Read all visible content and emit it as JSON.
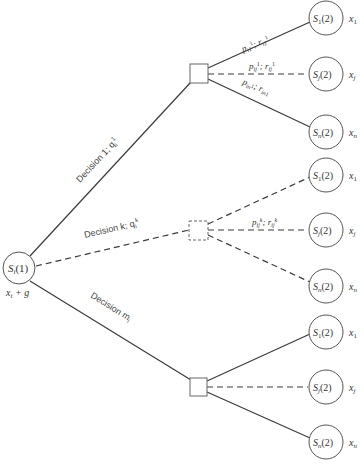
{
  "diagram": {
    "type": "decision-tree",
    "root": {
      "label": "S",
      "sub": "i",
      "arg": "(1)",
      "below_label": "x",
      "below_sub": "i",
      "below_rest": " + g"
    },
    "decisions": [
      {
        "label": "Decision 1; q",
        "sup": "1",
        "sub": "i",
        "style": "solid",
        "branches": [
          {
            "state": "S",
            "state_sub": "1",
            "arg": "(2)",
            "value": "x",
            "value_sub": "1",
            "edge_label": "p",
            "edge_label_sub": "i1",
            "edge_label_sup": "1",
            "edge_label2": "; r",
            "edge_label2_sub": "i1",
            "edge_label2_sup": "1",
            "style": "solid"
          },
          {
            "state": "S",
            "state_sub": "j",
            "arg": "(2)",
            "value": "x",
            "value_sub": "j",
            "edge_label": "p",
            "edge_label_sub": "ij",
            "edge_label_sup": "1",
            "edge_label2": "; r",
            "edge_label2_sub": "ij",
            "edge_label2_sup": "1",
            "style": "dashed"
          },
          {
            "state": "S",
            "state_sub": "n",
            "arg": "(2)",
            "value": "x",
            "value_sub": "n",
            "edge_label": "p",
            "edge_label_sub": "in",
            "edge_label_sup": "1",
            "edge_label2": "; r",
            "edge_label2_sub": "in",
            "edge_label2_sup": "1",
            "style": "solid"
          }
        ]
      },
      {
        "label": "Decision k; q",
        "sup": "k",
        "sub": "i",
        "style": "dashed",
        "branches": [
          {
            "state": "S",
            "state_sub": "1",
            "arg": "(2)",
            "value": "x",
            "value_sub": "1",
            "style": "dashed"
          },
          {
            "state": "S",
            "state_sub": "j",
            "arg": "(2)",
            "value": "x",
            "value_sub": "j",
            "edge_label": "p",
            "edge_label_sub": "ij",
            "edge_label_sup": "k",
            "edge_label2": "; r",
            "edge_label2_sub": "ij",
            "edge_label2_sup": "k",
            "style": "dashed"
          },
          {
            "state": "S",
            "state_sub": "n",
            "arg": "(2)",
            "value": "x",
            "value_sub": "n",
            "style": "dashed"
          }
        ]
      },
      {
        "label": "Decision m",
        "sup": "",
        "sub": "i",
        "style": "solid",
        "branches": [
          {
            "state": "S",
            "state_sub": "1",
            "arg": "(2)",
            "value": "x",
            "value_sub": "1",
            "style": "solid"
          },
          {
            "state": "S",
            "state_sub": "j",
            "arg": "(2)",
            "value": "x",
            "value_sub": "j",
            "style": "dashed"
          },
          {
            "state": "S",
            "state_sub": "n",
            "arg": "(2)",
            "value": "x",
            "value_sub": "n",
            "style": "solid"
          }
        ]
      }
    ]
  }
}
